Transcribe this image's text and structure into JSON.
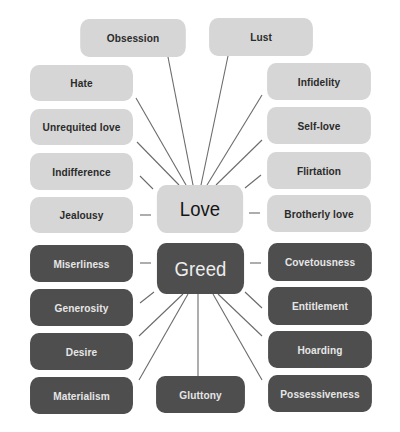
{
  "diagram": {
    "type": "concept-map",
    "colors": {
      "light_node": "#d6d6d6",
      "dark_node": "#4e4e4e",
      "connector": "#6b6b6b",
      "background": "#ffffff"
    },
    "hubs": {
      "love": {
        "label": "Love",
        "x": 151,
        "y": 185,
        "w": 98,
        "h": 48,
        "theme": "light"
      },
      "greed": {
        "label": "Greed",
        "x": 151,
        "y": 243,
        "w": 99,
        "h": 51,
        "theme": "dark"
      }
    },
    "love_nodes": [
      {
        "label": "Obsession",
        "x": 73,
        "y": 19,
        "w": 120,
        "h": 38,
        "anchor": [
          168,
          57
        ],
        "hub_point": [
          193,
          185
        ]
      },
      {
        "label": "Lust",
        "x": 202,
        "y": 18,
        "w": 118,
        "h": 38,
        "anchor": [
          228,
          56
        ],
        "hub_point": [
          201,
          185
        ]
      },
      {
        "label": "Hate",
        "x": 23,
        "y": 65,
        "w": 117,
        "h": 36,
        "anchor": [
          136,
          98
        ],
        "hub_point": [
          186,
          185
        ]
      },
      {
        "label": "Infidelity",
        "x": 260,
        "y": 63,
        "w": 118,
        "h": 37,
        "anchor": [
          262,
          95
        ],
        "hub_point": [
          207,
          185
        ]
      },
      {
        "label": "Unrequited love",
        "x": 23,
        "y": 109,
        "w": 117,
        "h": 36,
        "anchor": [
          137,
          142
        ],
        "hub_point": [
          179,
          185
        ]
      },
      {
        "label": "Self-love",
        "x": 260,
        "y": 107,
        "w": 118,
        "h": 37,
        "anchor": [
          262,
          140
        ],
        "hub_point": [
          216,
          185
        ]
      },
      {
        "label": "Indifference",
        "x": 23,
        "y": 153,
        "w": 117,
        "h": 37,
        "anchor": [
          140,
          176
        ],
        "hub_point": [
          153,
          189
        ]
      },
      {
        "label": "Flirtation",
        "x": 260,
        "y": 152,
        "w": 118,
        "h": 37,
        "anchor": [
          261,
          175
        ],
        "hub_point": [
          245,
          188
        ]
      },
      {
        "label": "Jealousy",
        "x": 23,
        "y": 197,
        "w": 117,
        "h": 36,
        "anchor": [
          140,
          215
        ],
        "hub_point": [
          151,
          215
        ]
      },
      {
        "label": "Brotherly love",
        "x": 260,
        "y": 195,
        "w": 118,
        "h": 37,
        "anchor": [
          260,
          213
        ],
        "hub_point": [
          249,
          213
        ]
      }
    ],
    "greed_nodes": [
      {
        "label": "Miserliness",
        "x": 23,
        "y": 245,
        "w": 117,
        "h": 37,
        "anchor": [
          140,
          263
        ],
        "hub_point": [
          151,
          263
        ]
      },
      {
        "label": "Covetousness",
        "x": 261,
        "y": 243,
        "w": 118,
        "h": 38,
        "anchor": [
          261,
          263
        ],
        "hub_point": [
          250,
          263
        ]
      },
      {
        "label": "Generosity",
        "x": 23,
        "y": 289,
        "w": 117,
        "h": 37,
        "anchor": [
          140,
          303
        ],
        "hub_point": [
          154,
          292
        ]
      },
      {
        "label": "Entitlement",
        "x": 261,
        "y": 287,
        "w": 118,
        "h": 38,
        "anchor": [
          262,
          308
        ],
        "hub_point": [
          245,
          292
        ]
      },
      {
        "label": "Desire",
        "x": 23,
        "y": 333,
        "w": 117,
        "h": 37,
        "anchor": [
          139,
          336
        ],
        "hub_point": [
          183,
          294
        ]
      },
      {
        "label": "Hoarding",
        "x": 261,
        "y": 331,
        "w": 118,
        "h": 37,
        "anchor": [
          262,
          336
        ],
        "hub_point": [
          218,
          294
        ]
      },
      {
        "label": "Materialism",
        "x": 23,
        "y": 377,
        "w": 117,
        "h": 37,
        "anchor": [
          139,
          380
        ],
        "hub_point": [
          188,
          294
        ]
      },
      {
        "label": "Gluttony",
        "x": 150,
        "y": 376,
        "w": 101,
        "h": 37,
        "anchor": [
          198,
          376
        ],
        "hub_point": [
          198,
          294
        ]
      },
      {
        "label": "Possessiveness",
        "x": 261,
        "y": 375,
        "w": 118,
        "h": 37,
        "anchor": [
          262,
          380
        ],
        "hub_point": [
          213,
          294
        ]
      }
    ]
  }
}
